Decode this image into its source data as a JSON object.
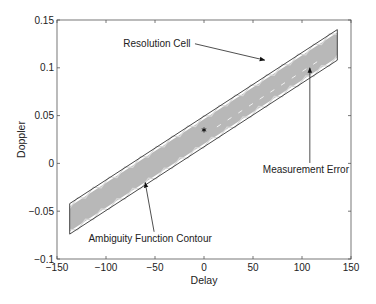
{
  "chart_data": {
    "type": "line",
    "title": "",
    "xlabel": "Delay",
    "ylabel": "Doppler",
    "xlim": [
      -150,
      150
    ],
    "ylim": [
      -0.1,
      0.15
    ],
    "grid": false,
    "legend": null,
    "xticks": [
      -150,
      -100,
      -50,
      0,
      50,
      100,
      150
    ],
    "xtick_labels": [
      "−150",
      "−100",
      "−50",
      "0",
      "50",
      "100",
      "150"
    ],
    "yticks": [
      -0.1,
      -0.05,
      0,
      0.05,
      0.1,
      0.15
    ],
    "ytick_labels": [
      "−0.1",
      "−0.05",
      "0",
      "0.05",
      "0.1",
      "0.15"
    ],
    "series": [
      {
        "name": "Resolution Cell",
        "kind": "parallelogram-outline",
        "color": "#333333",
        "points": [
          [
            -137,
            -0.042
          ],
          [
            136,
            0.14
          ],
          [
            136,
            0.108
          ],
          [
            -137,
            -0.074
          ]
        ]
      },
      {
        "name": "Ambiguity Function Contour",
        "kind": "filled-region",
        "color": "#b8b8b8",
        "points": [
          [
            -137,
            -0.045
          ],
          [
            136,
            0.137
          ],
          [
            136,
            0.111
          ],
          [
            -137,
            -0.071
          ]
        ]
      },
      {
        "name": "Measurement (center)",
        "kind": "marker",
        "marker": "*",
        "color": "#000000",
        "points": [
          [
            0,
            0.035
          ]
        ]
      }
    ],
    "annotations": [
      {
        "text": "Resolution Cell",
        "text_at": [
          -48,
          0.122
        ],
        "arrow_to": [
          62,
          0.108
        ]
      },
      {
        "text": "Measurement Error",
        "text_at": [
          104,
          -0.01
        ],
        "arrow_to": [
          108,
          0.1
        ]
      },
      {
        "text": "Ambiguity Function Contour",
        "text_at": [
          -55,
          -0.082
        ],
        "arrow_to": [
          -60,
          -0.02
        ]
      }
    ]
  }
}
